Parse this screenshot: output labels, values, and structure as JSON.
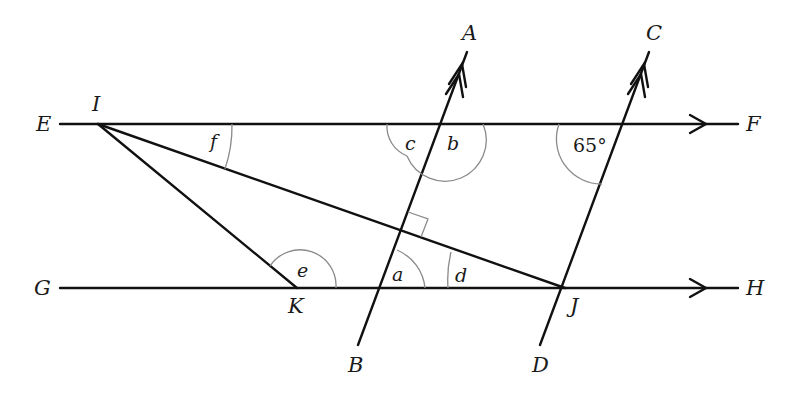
{
  "diagram": {
    "points": {
      "E": "E",
      "F": "F",
      "G": "G",
      "H": "H",
      "I": "I",
      "J": "J",
      "K": "K",
      "A": "A",
      "B": "B",
      "C": "C",
      "D": "D"
    },
    "angles": {
      "a": "a",
      "b": "b",
      "c": "c",
      "d": "d",
      "e": "e",
      "f": "f",
      "given": "65°"
    },
    "parallel_markers": {
      "EF_GH": "single-arrow",
      "AB_CD": "double-arrow"
    },
    "right_angle": "AB ⊥ IJ"
  }
}
